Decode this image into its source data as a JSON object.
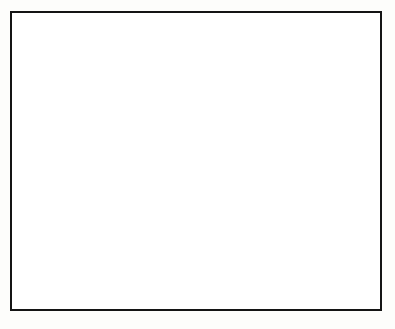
{
  "figure": {
    "background_color": "#ffffff",
    "frame_color": "#141414"
  },
  "legend": {
    "measured_label": "Measured",
    "calculated_label": "Calculated",
    "position": "inside-lower-right"
  },
  "chart_data": [
    {
      "type": "line",
      "panel": "top",
      "title": "Lₑv frequency",
      "title_main": "L",
      "title_sub": "e",
      "title_rest": "v frequency",
      "xlabel": "",
      "ylabel": "Lₑ (µH)",
      "ylabel_main": "L",
      "ylabel_sub": "e",
      "ylabel_rest": " (µH)",
      "xlim": [
        1,
        8
      ],
      "ylim": [
        30,
        65
      ],
      "yscale": "linear",
      "xscale": "linear",
      "yticks": [
        30,
        40,
        50,
        60
      ],
      "ytick_labels": [
        "30",
        "40",
        "50",
        "60"
      ],
      "xticks": [
        1,
        2,
        3,
        4,
        5,
        6,
        7,
        8
      ],
      "grid": false,
      "series": [
        {
          "name": "A1",
          "curve_label": "A1",
          "marker": "calculated",
          "x": [
            1.25,
            1.55,
            1.85,
            2.2,
            2.6,
            3.0,
            3.35,
            3.7,
            4.1,
            4.5,
            4.9,
            5.3,
            5.7,
            6.1,
            6.5,
            6.9,
            7.25,
            7.6,
            7.85
          ],
          "y": [
            40.1,
            40.3,
            40.5,
            40.7,
            41.0,
            41.3,
            41.6,
            42.0,
            42.4,
            42.9,
            43.5,
            44.2,
            45.0,
            45.9,
            46.8,
            47.7,
            48.6,
            49.4,
            50.0
          ]
        }
      ]
    },
    {
      "type": "line",
      "panel": "bottom",
      "title": "Qₑv frequency",
      "title_main": "Q",
      "title_sub": "e",
      "title_rest": "v frequency",
      "xlabel": "Frequency (MHz)",
      "ylabel": "Qₑ",
      "ylabel_main": "Q",
      "ylabel_sub": "e",
      "ylabel_rest": "",
      "xlim": [
        1,
        8
      ],
      "ylim": [
        100,
        900
      ],
      "yscale": "log",
      "xscale": "linear",
      "yticks": [
        100,
        200,
        300,
        400,
        500,
        600,
        800
      ],
      "ytick_labels": [
        "100",
        "200",
        "300",
        "400",
        "500",
        "600",
        "800"
      ],
      "xticks": [
        1,
        2,
        3,
        4,
        5,
        6,
        7,
        8
      ],
      "grid": false,
      "series": [
        {
          "name": "C",
          "curve_label": "C",
          "marker": "measured+calculated",
          "x": [
            1.2,
            1.5,
            1.8,
            2.1,
            2.45,
            2.8,
            3.15,
            3.5,
            3.85,
            4.2,
            4.55,
            4.9,
            5.25,
            5.6,
            5.95,
            6.3,
            6.65,
            7.0,
            7.4,
            7.8
          ],
          "y": [
            390,
            440,
            480,
            515,
            548,
            578,
            602,
            622,
            640,
            655,
            668,
            678,
            688,
            696,
            703,
            709,
            714,
            718,
            722,
            724
          ],
          "calculated_from_x": 4.2,
          "outlier_points": [
            {
              "x": 4.6,
              "y": 600
            },
            {
              "x": 5.0,
              "y": 598
            }
          ]
        },
        {
          "name": "B",
          "curve_label": "B",
          "marker": "measured+calculated",
          "x": [
            1.2,
            1.5,
            1.8,
            2.1,
            2.45,
            2.8,
            3.15,
            3.5,
            3.85,
            4.2,
            4.55,
            4.9,
            5.25,
            5.6,
            5.95,
            6.3,
            6.65,
            7.0,
            7.4,
            7.8
          ],
          "y": [
            243,
            272,
            298,
            320,
            340,
            357,
            370,
            380,
            388,
            393,
            400,
            408,
            415,
            421,
            427,
            432,
            437,
            441,
            445,
            448
          ],
          "calculated_from_x": 4.2,
          "outlier_points": []
        },
        {
          "name": "A",
          "curve_label": "A",
          "marker": "measured+calculated",
          "x": [
            1.2,
            1.5,
            1.8,
            2.1,
            2.45,
            2.8,
            3.15,
            3.5,
            3.85,
            4.2,
            4.55,
            4.9,
            5.25,
            5.6,
            5.95,
            6.3,
            6.65,
            7.0,
            7.4,
            7.8
          ],
          "y": [
            172,
            192,
            210,
            224,
            236,
            246,
            253,
            258,
            262,
            265,
            268,
            271,
            274,
            277,
            279,
            281,
            282,
            282,
            281,
            279
          ],
          "calculated_from_x": 4.2,
          "outlier_points": [
            {
              "x": 5.0,
              "y": 252
            },
            {
              "x": 5.4,
              "y": 248
            }
          ]
        }
      ]
    }
  ]
}
